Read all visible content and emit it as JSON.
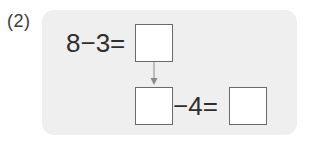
{
  "problem": {
    "number_label": "(2)",
    "top_equation": {
      "expression": "8−3=",
      "answer_box": ""
    },
    "arrow": "down-arrow",
    "bottom_equation": {
      "first_box": "",
      "expression": "−4=",
      "answer_box": ""
    }
  },
  "colors": {
    "panel_background": "#efefef",
    "box_border": "#6a6a6a",
    "text": "#2e2e2e"
  }
}
